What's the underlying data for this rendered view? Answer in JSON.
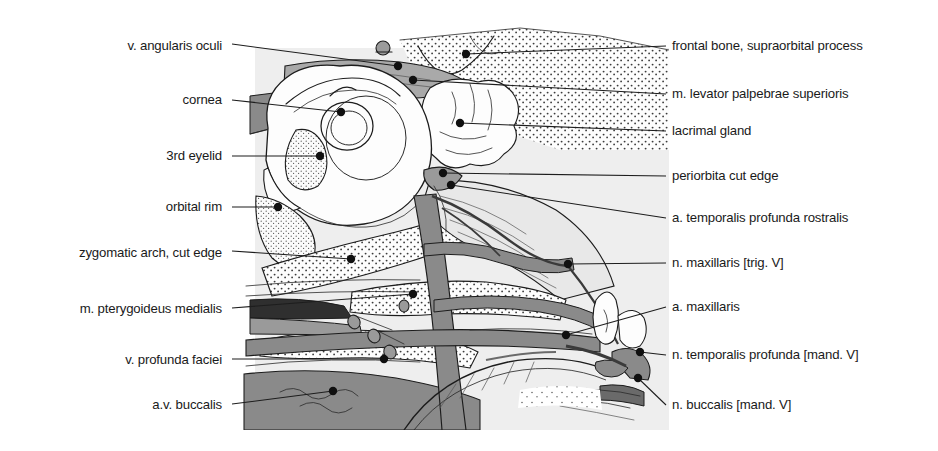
{
  "figure": {
    "background_color": "#ffffff",
    "plate_background_color": "#eeeeee",
    "palette": {
      "outline": "#1c1c1c",
      "vessel_gray": "#8a8a8a",
      "muscle_light_gray": "#e6e6e6",
      "muscle_mid_gray": "#b9b9b9",
      "bone_white": "#fdfdfd",
      "dark_shadow": "#3a3a3a",
      "leader_line": "#1d1d1d",
      "label_text": "#1a1a1a"
    },
    "plate_bounds": {
      "x": 239,
      "y": 24,
      "width": 430,
      "height": 406
    }
  },
  "labels_left": [
    {
      "id": "v-angularis-oculi",
      "text": "v. angularis oculi",
      "x": 222,
      "y": 46,
      "leader": [
        [
          232,
          44
        ],
        [
          398,
          66
        ]
      ],
      "dot": [
        398,
        66
      ]
    },
    {
      "id": "cornea",
      "text": "cornea",
      "x": 222,
      "y": 100,
      "leader": [
        [
          232,
          100
        ],
        [
          341,
          112
        ]
      ],
      "dot": [
        341,
        112
      ]
    },
    {
      "id": "third-eyelid",
      "text": "3rd eyelid",
      "x": 222,
      "y": 156,
      "leader": [
        [
          232,
          156
        ],
        [
          320,
          156
        ]
      ],
      "dot": [
        320,
        156
      ]
    },
    {
      "id": "orbital-rim",
      "text": "orbital rim",
      "x": 222,
      "y": 207,
      "leader": [
        [
          232,
          207
        ],
        [
          278,
          207
        ]
      ],
      "dot": [
        278,
        207
      ]
    },
    {
      "id": "zygomatic-arch-cut-edge",
      "text": "zygomatic arch, cut edge",
      "x": 222,
      "y": 253,
      "leader": [
        [
          232,
          251
        ],
        [
          351,
          259
        ]
      ],
      "dot": [
        351,
        259
      ]
    },
    {
      "id": "m-pterygoideus-medialis",
      "text": "m. pterygoideus medialis",
      "x": 222,
      "y": 309,
      "leader": [
        [
          232,
          308
        ],
        [
          413,
          294
        ]
      ],
      "dot": [
        413,
        294
      ]
    },
    {
      "id": "v-profunda-faciei",
      "text": "v. profunda faciei",
      "x": 222,
      "y": 360,
      "leader": [
        [
          232,
          359
        ],
        [
          384,
          359
        ]
      ],
      "dot": [
        384,
        359
      ]
    },
    {
      "id": "a-v-buccalis",
      "text": "a.v. buccalis",
      "x": 222,
      "y": 405,
      "leader": [
        [
          232,
          404
        ],
        [
          333,
          391
        ]
      ],
      "dot": [
        333,
        391
      ]
    }
  ],
  "labels_right": [
    {
      "id": "frontal-bone-supraorbital-process",
      "text": "frontal bone, supraorbital process",
      "x": 672,
      "y": 46,
      "leader": [
        [
          666,
          46
        ],
        [
          466,
          54
        ]
      ],
      "dot": [
        466,
        54
      ]
    },
    {
      "id": "m-levator-palpebrae-superioris",
      "text": "m. levator palpebrae superioris",
      "x": 672,
      "y": 94,
      "leader": [
        [
          666,
          94
        ],
        [
          413,
          80
        ]
      ],
      "dot": [
        413,
        80
      ]
    },
    {
      "id": "lacrimal-gland",
      "text": "lacrimal gland",
      "x": 672,
      "y": 131,
      "leader": [
        [
          666,
          131
        ],
        [
          460,
          123
        ]
      ],
      "dot": [
        460,
        123
      ]
    },
    {
      "id": "periorbita-cut-edge",
      "text": "periorbita cut edge",
      "x": 672,
      "y": 176,
      "leader": [
        [
          666,
          176
        ],
        [
          443,
          173
        ]
      ],
      "dot": [
        443,
        173
      ]
    },
    {
      "id": "a-temporalis-profunda-rostralis",
      "text": "a. temporalis profunda rostralis",
      "x": 672,
      "y": 218,
      "leader": [
        [
          666,
          218
        ],
        [
          451,
          185
        ]
      ],
      "dot": [
        451,
        185
      ]
    },
    {
      "id": "n-maxillaris-trig-v",
      "text": "n. maxillaris [trig. V]",
      "x": 672,
      "y": 263,
      "leader": [
        [
          666,
          263
        ],
        [
          568,
          264
        ]
      ],
      "dot": [
        568,
        264
      ]
    },
    {
      "id": "a-maxillaris",
      "text": "a. maxillaris",
      "x": 672,
      "y": 307,
      "leader": [
        [
          666,
          307
        ],
        [
          566,
          335
        ]
      ],
      "dot": [
        566,
        335
      ]
    },
    {
      "id": "n-temporalis-profunda-mand-v",
      "text": "n. temporalis profunda [mand. V]",
      "x": 672,
      "y": 355,
      "leader": [
        [
          666,
          355
        ],
        [
          640,
          352
        ]
      ],
      "dot": [
        640,
        352
      ]
    },
    {
      "id": "n-buccalis-mand-v",
      "text": "n. buccalis [mand. V]",
      "x": 672,
      "y": 405,
      "leader": [
        [
          666,
          405
        ],
        [
          638,
          378
        ]
      ],
      "dot": [
        638,
        378
      ]
    }
  ]
}
